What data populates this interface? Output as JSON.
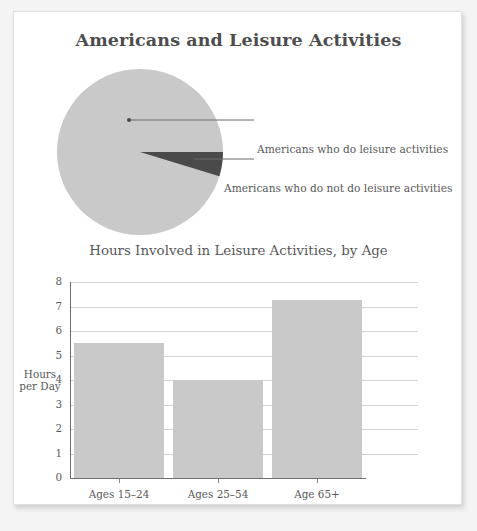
{
  "card": {
    "title": "Americans and Leisure Activities"
  },
  "pie": {
    "labels": [
      "Americans who do leisure activities",
      "Americans who do not do leisure activities"
    ],
    "slices": [
      {
        "name": "Americans who do leisure activities",
        "value": 95.3,
        "color": "#c9c9c9"
      },
      {
        "name": "Americans who do not do leisure activities",
        "value": 4.7,
        "color": "#4a4a4a"
      }
    ]
  },
  "bar": {
    "subtitle": "Hours Involved in Leisure Activities, by Age",
    "yaxis_title_line1": "Hours",
    "yaxis_title_line2": "per Day",
    "yticks": [
      "8",
      "7",
      "6",
      "5",
      "4",
      "3",
      "2",
      "1",
      "0"
    ],
    "categories": [
      "Ages 15–24",
      "Ages 25–54",
      "Age 65+"
    ],
    "values": [
      5.5,
      4.0,
      7.25
    ]
  },
  "chart_data": [
    {
      "type": "pie",
      "title": "Americans and Leisure Activities",
      "labels": [
        "Americans who do leisure activities",
        "Americans who do not do leisure activities"
      ],
      "values": [
        95.3,
        4.7
      ],
      "colors": [
        "#c9c9c9",
        "#4a4a4a"
      ],
      "legend": "callout-labels-right",
      "grid": false
    },
    {
      "type": "bar",
      "title": "Hours Involved in Leisure Activities, by Age",
      "categories": [
        "Ages 15–24",
        "Ages 25–54",
        "Age 65+"
      ],
      "values": [
        5.5,
        4.0,
        7.25
      ],
      "xlabel": "",
      "ylabel": "Hours per Day",
      "ylim": [
        0,
        8
      ],
      "ytick_step": 1,
      "bar_color": "#c9c9c9",
      "grid": true,
      "legend": "none"
    }
  ]
}
